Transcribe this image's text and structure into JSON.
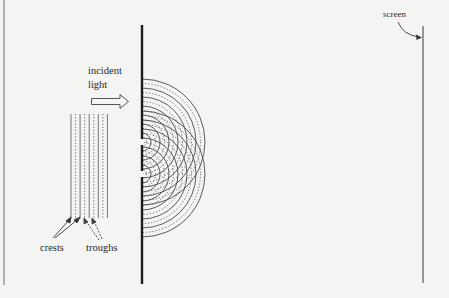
{
  "diagram": {
    "labels": {
      "incident_line1": "incident",
      "incident_line2": "light",
      "crests": "crests",
      "troughs": "troughs",
      "screen": "screen"
    },
    "incident_waves": {
      "crest_count": 5,
      "trough_count": 4
    },
    "slits": {
      "count": 2
    },
    "diffracted_wavefronts": {
      "per_slit_rings": 7,
      "style": "alternating solid crests and dashed troughs"
    },
    "colors": {
      "background": "#f4f4f2",
      "barrier": "#1c1c1c",
      "lines": "#555555",
      "text": "#2a2a2a"
    }
  }
}
